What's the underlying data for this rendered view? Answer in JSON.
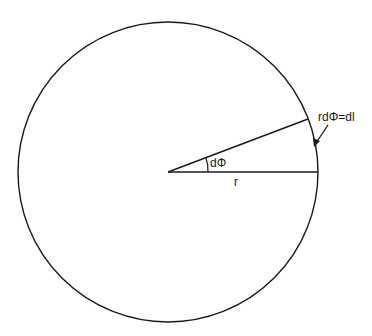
{
  "diagram": {
    "type": "geometry-arc-length",
    "labels": {
      "angle": "dΦ",
      "radius": "r",
      "arc_length": "rdΦ=dl"
    },
    "circle": {
      "cx": 168,
      "cy": 172,
      "r": 150
    },
    "colors": {
      "stroke": "#1a1a1a",
      "background": "#ffffff"
    }
  }
}
